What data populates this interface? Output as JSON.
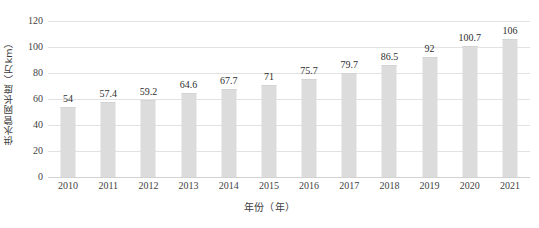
{
  "chart_data": {
    "type": "bar",
    "title": "",
    "xlabel": "年份（年）",
    "ylabel": "供水管网长度（万km）",
    "categories": [
      "2010",
      "2011",
      "2012",
      "2013",
      "2014",
      "2015",
      "2016",
      "2017",
      "2018",
      "2019",
      "2020",
      "2021"
    ],
    "values": [
      54,
      57.4,
      59.2,
      64.6,
      67.7,
      71,
      75.7,
      79.7,
      86.5,
      92,
      100.7,
      106
    ],
    "value_labels": [
      "54",
      "57.4",
      "59.2",
      "64.6",
      "67.7",
      "71",
      "75.7",
      "79.7",
      "86.5",
      "92",
      "100.7",
      "106"
    ],
    "ylim": [
      0,
      120
    ],
    "ytick_labels": [
      "0",
      "20",
      "40",
      "60",
      "80",
      "100",
      "120"
    ],
    "ytick_values": [
      0,
      20,
      40,
      60,
      80,
      100,
      120
    ],
    "grid": true,
    "legend": false,
    "bar_color": "#dcdcdc",
    "gridline_color": "#e2e2e2",
    "background_color": "#ffffff",
    "text_color": "#3f3f3f"
  }
}
